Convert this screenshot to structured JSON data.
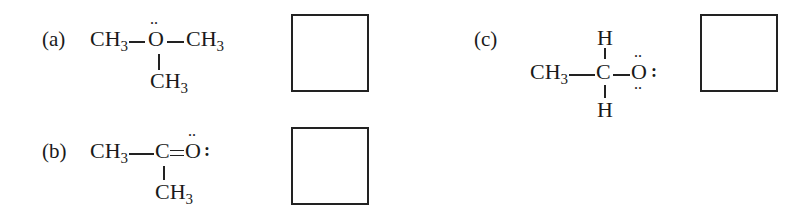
{
  "questions": [
    {
      "label": "(a)",
      "left_group": "CH",
      "left_sub": "3",
      "center_atom": "O",
      "right_group": "CH",
      "right_sub": "3",
      "bottom_group": "CH",
      "bottom_sub": "3",
      "lone_pairs_top": "··",
      "answer": ""
    },
    {
      "label": "(b)",
      "left_group": "CH",
      "left_sub": "3",
      "center_atom": "C",
      "double_bond_atom": "O",
      "bottom_group": "CH",
      "bottom_sub": "3",
      "lone_pairs_top": "··",
      "lone_pairs_right": ":",
      "answer": ""
    },
    {
      "label": "(c)",
      "left_group": "CH",
      "left_sub": "3",
      "center_atom": "C",
      "top_atom": "H",
      "bottom_atom": "H",
      "right_atom": "O",
      "lone_pairs_top": "··",
      "lone_pairs_bottom": "··",
      "lone_pairs_right": ":",
      "answer": ""
    }
  ]
}
